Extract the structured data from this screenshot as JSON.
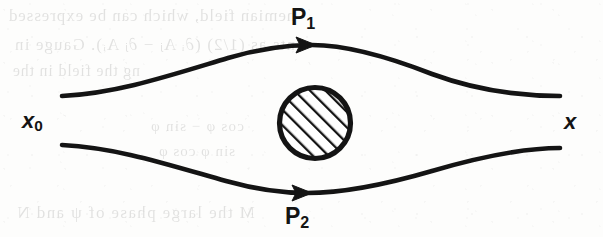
{
  "figure": {
    "kind": "path-diagram",
    "background_color": "#fdfdfc",
    "ink_color": "#141414"
  },
  "labels": {
    "path_upper": {
      "base": "P",
      "sub": "1"
    },
    "path_lower": {
      "base": "P",
      "sub": "2"
    },
    "start_point": {
      "base": "x",
      "sub": "0"
    },
    "end_point": {
      "base": "x",
      "sub": ""
    }
  },
  "paths": [
    {
      "name": "upper-path",
      "label": "P1",
      "start": [
        62,
        96
      ],
      "end": [
        560,
        96
      ],
      "apex": [
        310,
        45
      ],
      "arrow_at": [
        310,
        45
      ],
      "arrow_direction": "right"
    },
    {
      "name": "lower-path",
      "label": "P2",
      "start": [
        62,
        145
      ],
      "end": [
        560,
        148
      ],
      "apex": [
        305,
        193
      ],
      "arrow_at": [
        305,
        193
      ],
      "arrow_direction": "right"
    }
  ],
  "obstacle": {
    "name": "hatched-circle",
    "center": [
      315,
      123
    ],
    "radius": 38,
    "fill_pattern": "diagonal-hatch-45deg",
    "stroke_width": 5
  },
  "ghost_text": {
    "line_1": "hemian field, which can be expressed",
    "line_2": "ents as (1/2) (∂ᵢ Aⱼ − ∂ⱼ Aᵢ). Gauge in",
    "line_3": "ng the field in the",
    "line_4": "cos φ − sin φ",
    "line_5": "sin φ   cos φ",
    "line_6": "M   the large phase of   ψ   and   N"
  }
}
